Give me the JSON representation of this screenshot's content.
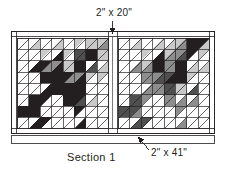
{
  "diagram": {
    "title": "Section 1",
    "caption_label": "Section 1",
    "type": "quilt-assembly-diagram",
    "annotations": [
      {
        "id": "top-sash",
        "label": "2\" x 20\"",
        "points_to": "vertical-center-sashing",
        "leader": "vertical-down-arrow"
      },
      {
        "id": "bottom-strip",
        "label": "2\" x 41\"",
        "points_to": "bottom-horizontal-strip",
        "leader": "diagonal-up-left-arrow"
      }
    ],
    "colors": {
      "outline": "#231f20",
      "background": "#ffffff",
      "fabric_white": "#ffffff",
      "fabric_light_gray": "#c9c9c9",
      "fabric_mid_gray": "#8d8d8d",
      "fabric_dark_gray": "#4f4f4f",
      "fabric_black": "#231f20",
      "sash": "#ffffff"
    },
    "blocks": [
      {
        "id": "block-left",
        "name": "left-quilt-block",
        "grid": "8x8 half-square-triangle"
      },
      {
        "id": "block-right",
        "name": "right-quilt-block",
        "grid": "8x8 half-square-triangle"
      }
    ],
    "frame": {
      "outer_border": "2-inch sashing frame",
      "center_sashing_label": "2\" x 20\"",
      "bottom_strip_label": "2\" x 41\""
    }
  }
}
